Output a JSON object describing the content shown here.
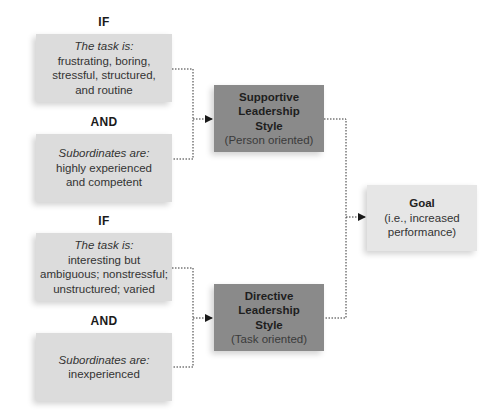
{
  "diagram": {
    "group_supportive": {
      "if_label": "IF",
      "task_box": {
        "lead": "The task is:",
        "lines": [
          "frustrating, boring,",
          "stressful, structured,",
          "and routine"
        ]
      },
      "and_label": "AND",
      "subordinates_box": {
        "lead": "Subordinates are:",
        "lines": [
          "highly experienced",
          "and competent"
        ]
      }
    },
    "group_directive": {
      "if_label": "IF",
      "task_box": {
        "lead": "The task is:",
        "lines": [
          "interesting but",
          "ambiguous; nonstressful;",
          "unstructured; varied"
        ]
      },
      "and_label": "AND",
      "subordinates_box": {
        "lead": "Subordinates are:",
        "lines": [
          "inexperienced"
        ]
      }
    },
    "supportive_style": {
      "title_lines": [
        "Supportive",
        "Leadership",
        "Style"
      ],
      "subtitle": "(Person oriented)"
    },
    "directive_style": {
      "title_lines": [
        "Directive",
        "Leadership",
        "Style"
      ],
      "subtitle": "(Task oriented)"
    },
    "goal": {
      "title": "Goal",
      "lines": [
        "(i.e., increased",
        "performance)"
      ]
    },
    "colors": {
      "condition_box": "#dcdcdc",
      "style_box": "#8a8a8a",
      "goal_box": "#e6e6e6",
      "connector": "#333333"
    }
  }
}
